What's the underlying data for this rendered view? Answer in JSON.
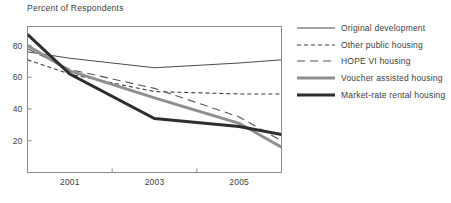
{
  "chart_data": {
    "type": "line",
    "title": "Percent of Respondents",
    "xlabel": "",
    "ylabel": "",
    "xlim": [
      2000,
      2006
    ],
    "ylim": [
      0,
      92
    ],
    "grid": false,
    "legend_position": "right",
    "x": [
      2000,
      2001,
      2003,
      2005,
      2006
    ],
    "xticks": [
      2001,
      2003,
      2005
    ],
    "xtick_labels": [
      "2001",
      "2003",
      "2005"
    ],
    "yticks": [
      20,
      40,
      60,
      80
    ],
    "ytick_labels": [
      "20",
      "40",
      "60",
      "80"
    ],
    "series": [
      {
        "name": "Original development",
        "style": "solid-thin",
        "color": "#4a4a4a",
        "width": 1,
        "values": [
          76,
          72,
          66,
          69,
          71
        ]
      },
      {
        "name": "Other public housing",
        "style": "dashed-short",
        "color": "#3c3c3c",
        "width": 1.1,
        "values": [
          71,
          62,
          51,
          49.5,
          49.5
        ]
      },
      {
        "name": "HOPE VI housing",
        "style": "dashed-long",
        "color": "#555555",
        "width": 1.1,
        "values": [
          78,
          65,
          53,
          35,
          20
        ]
      },
      {
        "name": "Voucher assisted housing",
        "style": "solid-thick-gray",
        "color": "#8f8f8f",
        "width": 3,
        "values": [
          80,
          64,
          47,
          31,
          16
        ]
      },
      {
        "name": "Market-rate rental housing",
        "style": "solid-thick-black",
        "color": "#2e2e2e",
        "width": 3,
        "values": [
          87,
          62,
          34,
          29,
          24
        ]
      }
    ]
  },
  "legend": {
    "items": [
      {
        "label": "Original development"
      },
      {
        "label": "Other public housing"
      },
      {
        "label": "HOPE VI housing"
      },
      {
        "label": "Voucher assisted housing"
      },
      {
        "label": "Market-rate rental housing"
      }
    ]
  },
  "axis": {
    "frame_color": "#8a8a8a"
  }
}
